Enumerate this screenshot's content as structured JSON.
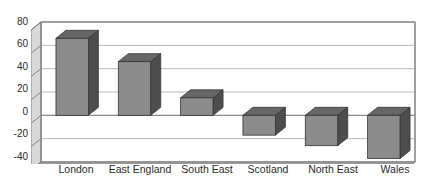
{
  "chart_data": {
    "type": "bar",
    "title": "",
    "subtitle": "",
    "xlabel": "",
    "ylabel": "",
    "categories": [
      "London",
      "East England",
      "South East",
      "Scotland",
      "North East",
      "Wales"
    ],
    "values": [
      66,
      46,
      15,
      -17,
      -26,
      -37
    ],
    "series": [
      {
        "name": "",
        "values": [
          66,
          46,
          15,
          -17,
          -26,
          -37
        ]
      }
    ],
    "ylim": [
      -40,
      80
    ],
    "yticks": [
      80,
      60,
      40,
      20,
      0,
      -20,
      -40
    ],
    "ytick_labels": [
      "80",
      "60",
      "40",
      "20",
      "0",
      "-20",
      "-40"
    ],
    "grid": true,
    "grid_axis": "y",
    "legend": false,
    "legend_position": "none",
    "three_d": true,
    "bar_face_color": "#8c8c8c",
    "bar_top_color": "#666666",
    "bar_side_color": "#4d4d4d",
    "bar_edge_color": "#333333",
    "grid_color": "#b8b8b8",
    "axis_color": "#808080",
    "floor_color": "#9a9a9a",
    "wall_color": "#d9d9d9",
    "plot_background": "#ffffff",
    "page_background": "#ffffff",
    "text_color": "#2b2b2b"
  }
}
